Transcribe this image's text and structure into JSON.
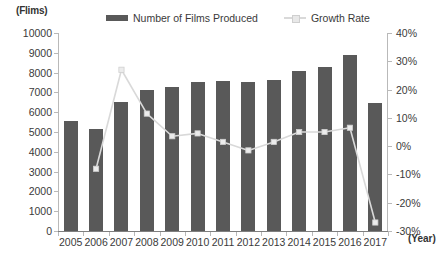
{
  "axis_unit_label": "(Flims)",
  "x_axis_title": "(Year)",
  "legend": [
    {
      "label": "Number of Films Produced",
      "marker": "bar-swatch",
      "color": "#595959"
    },
    {
      "label": "Growth Rate",
      "marker": "line-swatch",
      "color": "#d9d9d9"
    }
  ],
  "y_left_ticks": [
    "0",
    "1000",
    "2000",
    "3000",
    "4000",
    "5000",
    "6000",
    "7000",
    "8000",
    "9000",
    "10000"
  ],
  "y_right_ticks": [
    "-30%",
    "-20%",
    "-10%",
    "0%",
    "10%",
    "20%",
    "30%",
    "40%"
  ],
  "chart_data": {
    "type": "bar",
    "title": "",
    "subtitle": "",
    "xlabel": "(Year)",
    "ylabel": "(Flims)",
    "y2label": "",
    "ylim": [
      0,
      10000
    ],
    "y2lim": [
      -30,
      40
    ],
    "grid": false,
    "legend_position": "top-center",
    "categories": [
      "2005",
      "2006",
      "2007",
      "2008",
      "2009",
      "2010",
      "2011",
      "2012",
      "2013",
      "2014",
      "2015",
      "2016",
      "2017"
    ],
    "series": [
      {
        "name": "Number of Films Produced",
        "type": "bar",
        "axis": "left",
        "color": "#595959",
        "values": [
          5550,
          5150,
          6500,
          7100,
          7250,
          7550,
          7600,
          7550,
          7650,
          8100,
          8300,
          8900,
          6450
        ]
      },
      {
        "name": "Growth Rate",
        "type": "line",
        "axis": "right",
        "color": "#d9d9d9",
        "values": [
          null,
          -8.0,
          27.0,
          11.5,
          3.5,
          4.5,
          1.5,
          -1.5,
          1.5,
          5.0,
          5.0,
          6.5,
          -27.0
        ]
      }
    ]
  }
}
